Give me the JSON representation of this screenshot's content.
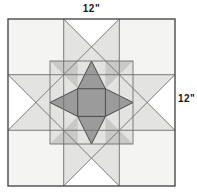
{
  "diagram": {
    "type": "quilt-block-schematic",
    "block_name": "star-within-a-star",
    "labels": {
      "top_dimension": "12\"",
      "right_dimension": "12\""
    },
    "geometry": {
      "block": {
        "x": 8,
        "y": 19,
        "size": 167
      },
      "grid_divisions": 3,
      "grid_lines_x": [
        8,
        63.7,
        119.3,
        175
      ],
      "grid_lines_y": [
        19,
        74.7,
        130.3,
        186
      ],
      "inner_star": {
        "x": 50,
        "y": 61,
        "size": 83
      },
      "inner_center_square": {
        "x": 77.7,
        "y": 88.7,
        "size": 27.7
      }
    },
    "colors": {
      "background": "#ffffff",
      "fabric_light": "#f4f4f2",
      "fabric_medium_light": "#e3e3e1",
      "fabric_medium": "#c9c9c7",
      "fabric_dark": "#9b9b9b",
      "fabric_darker": "#8c8c8c",
      "outline": "#4a4a4a",
      "outline_thin": "#6e6e6e",
      "label_text": "#1a1a1a"
    },
    "pieces": [
      {
        "name": "corner-square-top-left",
        "shade": "fabric_light"
      },
      {
        "name": "corner-square-top-right",
        "shade": "fabric_light"
      },
      {
        "name": "corner-square-bottom-left",
        "shade": "fabric_light"
      },
      {
        "name": "corner-square-bottom-right",
        "shade": "fabric_light"
      },
      {
        "name": "flying-geese-top",
        "shade": "fabric_medium_light"
      },
      {
        "name": "flying-geese-bottom",
        "shade": "fabric_medium_light"
      },
      {
        "name": "flying-geese-left",
        "shade": "fabric_medium_light"
      },
      {
        "name": "flying-geese-right",
        "shade": "fabric_medium_light"
      },
      {
        "name": "inner-star-center-square",
        "shade": "fabric_dark"
      },
      {
        "name": "inner-star-point-top",
        "shade": "fabric_dark"
      },
      {
        "name": "inner-star-point-bottom",
        "shade": "fabric_dark"
      },
      {
        "name": "inner-star-point-left",
        "shade": "fabric_dark"
      },
      {
        "name": "inner-star-point-right",
        "shade": "fabric_dark"
      }
    ]
  }
}
